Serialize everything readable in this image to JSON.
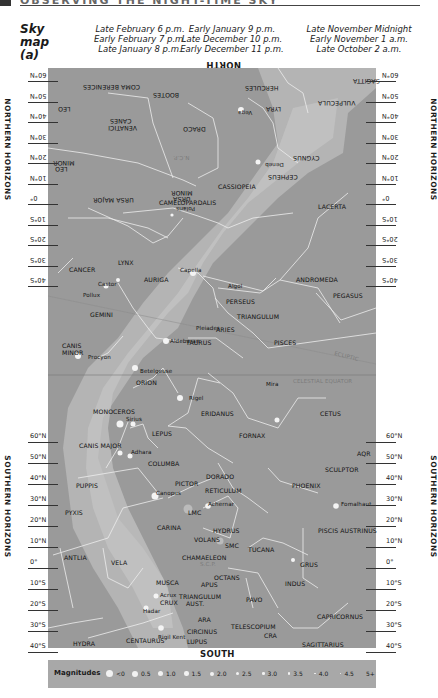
{
  "header": {
    "text": "OBSERVING THE NIGHT-TIME SKY"
  },
  "map_title": [
    "Sky",
    "map",
    "(a)"
  ],
  "times": [
    [
      "Late February 6 p.m.",
      "Early February 7 p.m.",
      "Late January 8 p.m."
    ],
    [
      "Early January 9 p.m.",
      "Late December 10 p.m.",
      "Early December 11 p.m."
    ],
    [
      "Late November Midnight",
      "Early November 1 a.m.",
      "Late October 2 a.m."
    ]
  ],
  "directions": {
    "north": "NORTH",
    "south": "SOUTH"
  },
  "side_labels": {
    "northern": "NORTHERN HORIZONS",
    "southern": "SOUTHERN HORIZONS"
  },
  "northern_ticks": [
    "60°N",
    "50°N",
    "40°N",
    "30°N",
    "20°N",
    "10°N",
    "0°",
    "10°S",
    "20°S",
    "30°S",
    "40°S"
  ],
  "southern_ticks": [
    "60°N",
    "50°N",
    "40°N",
    "30°N",
    "20°N",
    "10°N",
    "0°",
    "10°S",
    "20°S",
    "30°S",
    "40°S"
  ],
  "constellations_north_flipped": [
    {
      "name": "COMA BERENICES",
      "x": 35,
      "y": 16
    },
    {
      "name": "BOOTES",
      "x": 105,
      "y": 24
    },
    {
      "name": "HERCULES",
      "x": 197,
      "y": 17
    },
    {
      "name": "SAGITTA",
      "x": 305,
      "y": 10
    },
    {
      "name": "LEO",
      "x": 10,
      "y": 38
    },
    {
      "name": "LYRA",
      "x": 218,
      "y": 38
    },
    {
      "name": "VULPECULA",
      "x": 270,
      "y": 32
    },
    {
      "name": "CANES",
      "x": 62,
      "y": 50
    },
    {
      "name": "VENATICI",
      "x": 60,
      "y": 57
    },
    {
      "name": "DRACO",
      "x": 135,
      "y": 58
    },
    {
      "name": "LEO",
      "x": 7,
      "y": 98
    },
    {
      "name": "MINOR",
      "x": 5,
      "y": 92
    },
    {
      "name": "CYGNUS",
      "x": 245,
      "y": 87
    },
    {
      "name": "CEPHEUS",
      "x": 220,
      "y": 106
    },
    {
      "name": "URSA MAJOR",
      "x": 45,
      "y": 129
    },
    {
      "name": "URSA",
      "x": 125,
      "y": 128
    },
    {
      "name": "MINOR",
      "x": 123,
      "y": 122
    }
  ],
  "stars_north_flipped": [
    {
      "name": "Vega",
      "x": 190,
      "y": 42
    },
    {
      "name": "Deneb",
      "x": 217,
      "y": 94
    },
    {
      "name": "Polaris",
      "x": 128,
      "y": 138
    },
    {
      "name": "N.C.P.",
      "x": 125,
      "y": 87
    }
  ],
  "constellations": [
    {
      "name": "CAMELOPARDALIS",
      "x": 111,
      "y": 131
    },
    {
      "name": "CASSIOPEIA",
      "x": 170,
      "y": 115
    },
    {
      "name": "LACERTA",
      "x": 270,
      "y": 135
    },
    {
      "name": "LYNX",
      "x": 70,
      "y": 191
    },
    {
      "name": "CANCER",
      "x": 21,
      "y": 198
    },
    {
      "name": "AURIGA",
      "x": 96,
      "y": 208
    },
    {
      "name": "ANDROMEDA",
      "x": 248,
      "y": 208
    },
    {
      "name": "PEGASUS",
      "x": 285,
      "y": 224
    },
    {
      "name": "GEMINI",
      "x": 42,
      "y": 243
    },
    {
      "name": "PERSEUS",
      "x": 178,
      "y": 230
    },
    {
      "name": "TRIANGULUM",
      "x": 189,
      "y": 245
    },
    {
      "name": "ARIES",
      "x": 168,
      "y": 258
    },
    {
      "name": "PISCES",
      "x": 226,
      "y": 271
    },
    {
      "name": "CANIS",
      "x": 14,
      "y": 274
    },
    {
      "name": "MINOR",
      "x": 14,
      "y": 281
    },
    {
      "name": "TAURUS",
      "x": 138,
      "y": 271
    },
    {
      "name": "ORION",
      "x": 88,
      "y": 311
    },
    {
      "name": "MONOCEROS",
      "x": 45,
      "y": 340
    },
    {
      "name": "ERIDANUS",
      "x": 153,
      "y": 342
    },
    {
      "name": "CETUS",
      "x": 272,
      "y": 342
    },
    {
      "name": "LEPUS",
      "x": 104,
      "y": 362
    },
    {
      "name": "FORNAX",
      "x": 191,
      "y": 364
    },
    {
      "name": "CANIS MAJOR",
      "x": 31,
      "y": 374
    },
    {
      "name": "AQR",
      "x": 309,
      "y": 382
    },
    {
      "name": "SCULPTOR",
      "x": 277,
      "y": 398
    },
    {
      "name": "COLUMBA",
      "x": 100,
      "y": 392
    },
    {
      "name": "DORADO",
      "x": 158,
      "y": 405
    },
    {
      "name": "PICTOR",
      "x": 127,
      "y": 412
    },
    {
      "name": "PUPPIS",
      "x": 28,
      "y": 414
    },
    {
      "name": "PHOENIX",
      "x": 244,
      "y": 414
    },
    {
      "name": "RETICULUM",
      "x": 157,
      "y": 419
    },
    {
      "name": "PYXIS",
      "x": 17,
      "y": 441
    },
    {
      "name": "CARINA",
      "x": 109,
      "y": 456
    },
    {
      "name": "HYDRUS",
      "x": 165,
      "y": 459
    },
    {
      "name": "PISCIS AUSTRINUS",
      "x": 270,
      "y": 459
    },
    {
      "name": "VOLANS",
      "x": 146,
      "y": 468
    },
    {
      "name": "LMC",
      "x": 140,
      "y": 441
    },
    {
      "name": "SMC",
      "x": 177,
      "y": 474
    },
    {
      "name": "TUCANA",
      "x": 200,
      "y": 478
    },
    {
      "name": "ANTLIA",
      "x": 16,
      "y": 486
    },
    {
      "name": "VELA",
      "x": 63,
      "y": 491
    },
    {
      "name": "CHAMAELEON",
      "x": 134,
      "y": 486
    },
    {
      "name": "GRUS",
      "x": 252,
      "y": 493
    },
    {
      "name": "OCTANS",
      "x": 166,
      "y": 506
    },
    {
      "name": "MUSCA",
      "x": 108,
      "y": 511
    },
    {
      "name": "APUS",
      "x": 153,
      "y": 513
    },
    {
      "name": "INDUS",
      "x": 237,
      "y": 512
    },
    {
      "name": "TRIANGULUM",
      "x": 131,
      "y": 525
    },
    {
      "name": "AUST.",
      "x": 138,
      "y": 532
    },
    {
      "name": "PAVO",
      "x": 198,
      "y": 528
    },
    {
      "name": "CRUX",
      "x": 112,
      "y": 531
    },
    {
      "name": "CAPRICORNUS",
      "x": 269,
      "y": 545
    },
    {
      "name": "ARA",
      "x": 150,
      "y": 548
    },
    {
      "name": "TELESCOPIUM",
      "x": 183,
      "y": 555
    },
    {
      "name": "CIRCINUS",
      "x": 139,
      "y": 560
    },
    {
      "name": "CRA",
      "x": 216,
      "y": 564
    },
    {
      "name": "HYDRA",
      "x": 25,
      "y": 572
    },
    {
      "name": "CENTAURUS",
      "x": 78,
      "y": 569
    },
    {
      "name": "LUPUS",
      "x": 139,
      "y": 570
    },
    {
      "name": "SAGITTARIUS",
      "x": 254,
      "y": 573
    }
  ],
  "stars": [
    {
      "name": "Capella",
      "x": 132,
      "y": 199
    },
    {
      "name": "Castor",
      "x": 50,
      "y": 213
    },
    {
      "name": "Pollux",
      "x": 35,
      "y": 224
    },
    {
      "name": "Algol",
      "x": 180,
      "y": 215
    },
    {
      "name": "Pleiades",
      "x": 148,
      "y": 257
    },
    {
      "name": "Procyon",
      "x": 40,
      "y": 286
    },
    {
      "name": "Aldebaran",
      "x": 122,
      "y": 270
    },
    {
      "name": "Betelgeuse",
      "x": 92,
      "y": 300
    },
    {
      "name": "Mira",
      "x": 218,
      "y": 313
    },
    {
      "name": "Rigel",
      "x": 141,
      "y": 327
    },
    {
      "name": "Sirius",
      "x": 78,
      "y": 348
    },
    {
      "name": "Adhara",
      "x": 83,
      "y": 381
    },
    {
      "name": "Canopus",
      "x": 108,
      "y": 422
    },
    {
      "name": "Achernar",
      "x": 160,
      "y": 433
    },
    {
      "name": "Fomalhaut",
      "x": 293,
      "y": 433
    },
    {
      "name": "Acrux",
      "x": 112,
      "y": 524
    },
    {
      "name": "Hadar",
      "x": 95,
      "y": 540
    },
    {
      "name": "Rigil Kent",
      "x": 110,
      "y": 566
    },
    {
      "name": "S.C.P.",
      "x": 152,
      "y": 493
    }
  ],
  "annotations": [
    {
      "name": "ECLIPTIC",
      "x": 286,
      "y": 285,
      "rotate": 15
    },
    {
      "name": "CELESTIAL EQUATOR",
      "x": 245,
      "y": 310,
      "rotate": 0
    }
  ],
  "legend": {
    "title": "Magnitudes",
    "items": [
      {
        "label": "<0",
        "size": 7
      },
      {
        "label": "0.5",
        "size": 6
      },
      {
        "label": "1.0",
        "size": 5
      },
      {
        "label": "1.5",
        "size": 4.5
      },
      {
        "label": "2.0",
        "size": 4
      },
      {
        "label": "2.5",
        "size": 3
      },
      {
        "label": "3.0",
        "size": 2.6
      },
      {
        "label": "3.5",
        "size": 2.2
      },
      {
        "label": "4.0",
        "size": 1.8
      },
      {
        "label": "4.5",
        "size": 1.4
      },
      {
        "label": "5+",
        "size": 0
      }
    ]
  },
  "colors": {
    "sky": "#9a9a9a",
    "milky_way": "#b9b9b9",
    "milky_way_core": "#c8c8c8",
    "lines": "#f0f0f0",
    "legend_bg": "#a8a8a8"
  }
}
